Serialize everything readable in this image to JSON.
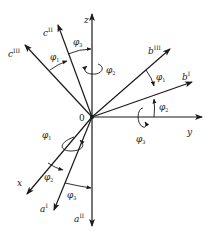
{
  "figure": {
    "type": "rotation-frames-diagram",
    "origin_label": "0",
    "axes": [
      {
        "id": "z",
        "label": "z",
        "sup": ""
      },
      {
        "id": "y",
        "label": "y",
        "sup": ""
      },
      {
        "id": "x",
        "label": "x",
        "sup": ""
      },
      {
        "id": "cII",
        "label": "c",
        "sup": "II"
      },
      {
        "id": "cIII",
        "label": "c",
        "sup": "III"
      },
      {
        "id": "bIII",
        "label": "b",
        "sup": "III"
      },
      {
        "id": "bI",
        "label": "b",
        "sup": "I"
      },
      {
        "id": "aI",
        "label": "a",
        "sup": "I"
      },
      {
        "id": "aII",
        "label": "a",
        "sup": "II"
      }
    ],
    "angles": [
      {
        "id": "phi3_top",
        "label": "φ",
        "sub": "3"
      },
      {
        "id": "phi1_top",
        "label": "φ",
        "sub": "1"
      },
      {
        "id": "phi2_z",
        "label": "φ",
        "sub": "2"
      },
      {
        "id": "phi1_right",
        "label": "φ",
        "sub": "1"
      },
      {
        "id": "phi2_right",
        "label": "φ",
        "sub": "2"
      },
      {
        "id": "phi3_y",
        "label": "φ",
        "sub": "3"
      },
      {
        "id": "phi1_x",
        "label": "φ",
        "sub": "1"
      },
      {
        "id": "phi2_bottom",
        "label": "φ",
        "sub": "2"
      },
      {
        "id": "phi3_bottom",
        "label": "φ",
        "sub": "3"
      }
    ]
  }
}
